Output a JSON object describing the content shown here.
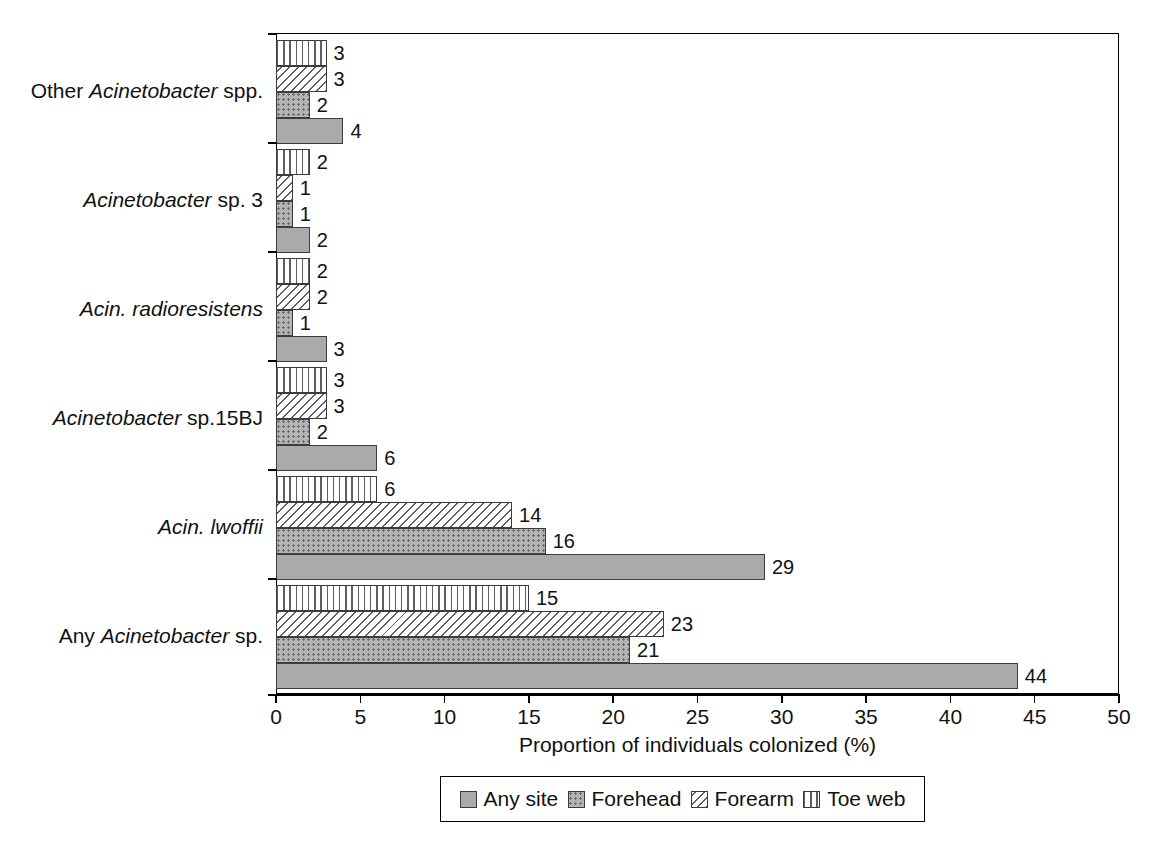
{
  "chart_data": {
    "type": "bar",
    "orientation": "horizontal",
    "title": "",
    "xlabel": "Proportion of individuals colonized (%)",
    "ylabel": "",
    "xlim": [
      0,
      50
    ],
    "xticks": [
      0,
      5,
      10,
      15,
      20,
      25,
      30,
      35,
      40,
      45,
      50
    ],
    "xtick_labels": [
      "0",
      "5",
      "10",
      "15",
      "20",
      "25",
      "30",
      "35",
      "40",
      "45",
      "50"
    ],
    "grid": false,
    "legend_position": "bottom",
    "categories": [
      "Any Acinetobacter sp.",
      "Acin. lwoffii",
      "Acinetobacter sp.15BJ",
      "Acin. radioresistens",
      "Acinetobacter sp. 3",
      "Other Acinetobacter spp."
    ],
    "series": [
      {
        "name": "Any site",
        "pattern": "solid-gray",
        "values": [
          44,
          29,
          6,
          3,
          2,
          4
        ]
      },
      {
        "name": "Forehead",
        "pattern": "dotted",
        "values": [
          21,
          16,
          2,
          1,
          1,
          2
        ]
      },
      {
        "name": "Forearm",
        "pattern": "diagonal-hatch",
        "values": [
          23,
          14,
          3,
          2,
          1,
          3
        ]
      },
      {
        "name": "Toe web",
        "pattern": "vertical-stripe",
        "values": [
          15,
          6,
          3,
          2,
          2,
          3
        ]
      }
    ]
  },
  "axis": {
    "x_title": "Proportion of individuals colonized (%)",
    "tick_labels": [
      "0",
      "5",
      "10",
      "15",
      "20",
      "25",
      "30",
      "35",
      "40",
      "45",
      "50"
    ]
  },
  "categories": [
    {
      "id": "other-acinetobacter-spp",
      "plain_label": "Other Acinetobacter spp.",
      "pre": "Other ",
      "italic": "Acinetobacter",
      "post": " spp."
    },
    {
      "id": "acinetobacter-sp-3",
      "plain_label": "Acinetobacter sp. 3",
      "pre": "",
      "italic": "Acinetobacter",
      "post": " sp. 3"
    },
    {
      "id": "acin-radioresistens",
      "plain_label": "Acin. radioresistens",
      "pre": "",
      "italic": "Acin. radioresistens",
      "post": ""
    },
    {
      "id": "acinetobacter-sp-15bj",
      "plain_label": "Acinetobacter sp.15BJ",
      "pre": "",
      "italic": "Acinetobacter",
      "post": " sp.15BJ"
    },
    {
      "id": "acin-lwoffii",
      "plain_label": "Acin. lwoffii",
      "pre": "",
      "italic": "Acin. lwoffii",
      "post": ""
    },
    {
      "id": "any-acinetobacter-sp",
      "plain_label": "Any Acinetobacter sp.",
      "pre": "Any ",
      "italic": "Acinetobacter",
      "post": " sp."
    }
  ],
  "legend": {
    "items": [
      {
        "label": "Any site",
        "pattern": "solid-gray"
      },
      {
        "label": "Forehead",
        "pattern": "dotted"
      },
      {
        "label": "Forearm",
        "pattern": "diagonal-hatch"
      },
      {
        "label": "Toe web",
        "pattern": "vertical-stripe"
      }
    ]
  },
  "colors": {
    "bar_any_site": "#aaaaaa",
    "bar_forehead": "#b4b4b4",
    "pattern_stroke": "#5f5f5f",
    "bar_outline": "#3c3c3c",
    "axis": "#000000",
    "text": "#111111",
    "background": "#ffffff"
  }
}
